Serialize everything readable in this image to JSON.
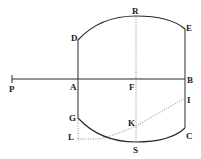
{
  "diagram": {
    "type": "geometric-figure",
    "ink_color": "#2a2a2a",
    "labels": {
      "P": "P",
      "A": "A",
      "F": "F",
      "B": "B",
      "D": "D",
      "R": "R",
      "E": "E",
      "G": "G",
      "K": "K",
      "I": "I",
      "L": "L",
      "S": "S",
      "C": "C"
    },
    "points": {
      "P": [
        12,
        79
      ],
      "A": [
        78,
        79
      ],
      "F": [
        136,
        79
      ],
      "B": [
        185,
        79
      ],
      "D": [
        78,
        40
      ],
      "R": [
        136,
        16
      ],
      "E": [
        185,
        29
      ],
      "G": [
        78,
        118
      ],
      "S": [
        136,
        142
      ],
      "C": [
        185,
        128
      ],
      "K": [
        136,
        126
      ],
      "I": [
        185,
        98
      ],
      "L": [
        78,
        139
      ]
    }
  }
}
